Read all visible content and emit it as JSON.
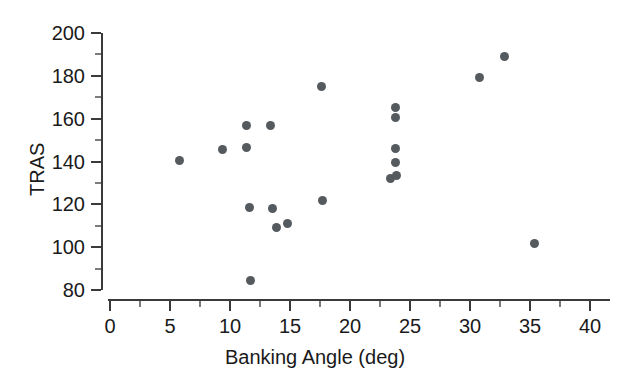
{
  "chart_data": {
    "type": "scatter",
    "title": "",
    "xlabel": "Banking Angle (deg)",
    "ylabel": "TRAS",
    "xlim": [
      0,
      41.7
    ],
    "ylim": [
      80,
      200
    ],
    "x_ticks": [
      0,
      5,
      10,
      15,
      20,
      25,
      30,
      35,
      40
    ],
    "y_ticks": [
      80,
      100,
      120,
      140,
      160,
      180,
      200
    ],
    "x_minor_step": 2.5,
    "y_minor_step": 10,
    "grid": false,
    "legend": null,
    "marker_color": "#555a5e",
    "axis_color": "#3a3a3a",
    "points": [
      {
        "x": 5.8,
        "y": 140.6
      },
      {
        "x": 9.4,
        "y": 145.8
      },
      {
        "x": 11.4,
        "y": 156.6
      },
      {
        "x": 11.4,
        "y": 146.5
      },
      {
        "x": 11.6,
        "y": 118.7
      },
      {
        "x": 11.7,
        "y": 84.5
      },
      {
        "x": 13.4,
        "y": 156.6
      },
      {
        "x": 13.5,
        "y": 118.0
      },
      {
        "x": 13.9,
        "y": 109.4
      },
      {
        "x": 14.8,
        "y": 111.2
      },
      {
        "x": 17.6,
        "y": 175.2
      },
      {
        "x": 17.7,
        "y": 122.0
      },
      {
        "x": 23.4,
        "y": 132.0
      },
      {
        "x": 23.8,
        "y": 165.4
      },
      {
        "x": 23.8,
        "y": 160.6
      },
      {
        "x": 23.8,
        "y": 146.2
      },
      {
        "x": 23.8,
        "y": 139.5
      },
      {
        "x": 23.9,
        "y": 133.3
      },
      {
        "x": 30.8,
        "y": 179.0
      },
      {
        "x": 32.9,
        "y": 189.0
      },
      {
        "x": 35.4,
        "y": 101.8
      }
    ]
  },
  "labels": {
    "y_axis_title": "TRAS",
    "x_axis_title": "Banking Angle (deg)"
  }
}
